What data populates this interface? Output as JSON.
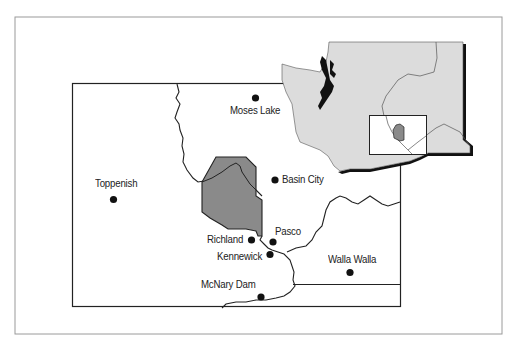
{
  "map": {
    "colors": {
      "frame": "#9a9a9a",
      "land_inset": "#dcdcdc",
      "hanford_fill": "#8a8a8a",
      "lines": "#222222",
      "background": "#ffffff"
    },
    "cities": [
      {
        "name": "Moses Lake",
        "x": 255,
        "y": 98
      },
      {
        "name": "Basin City",
        "x": 275,
        "y": 180
      },
      {
        "name": "Toppenish",
        "x": 113,
        "y": 199
      },
      {
        "name": "Pasco",
        "x": 273,
        "y": 242
      },
      {
        "name": "Richland",
        "x": 252,
        "y": 240
      },
      {
        "name": "Kennewick",
        "x": 270,
        "y": 254
      },
      {
        "name": "Walla Walla",
        "x": 350,
        "y": 272
      },
      {
        "name": "McNary Dam",
        "x": 261,
        "y": 296
      }
    ],
    "inset": {
      "region": "Washington State",
      "highlight_box": "study area locator"
    },
    "hanford_area": "shaded site"
  }
}
